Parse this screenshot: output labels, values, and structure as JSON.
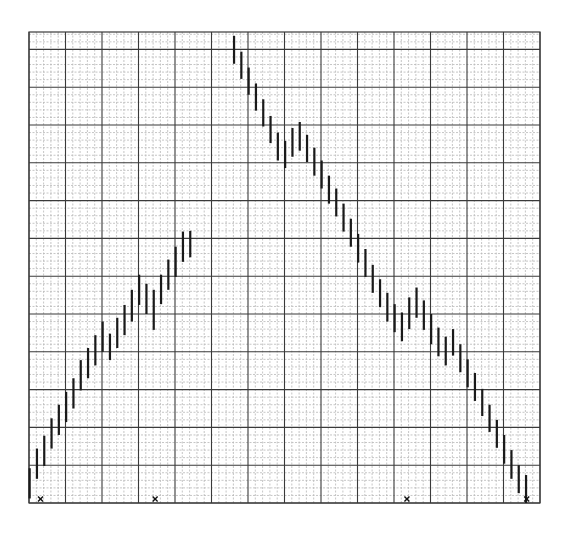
{
  "chart_data": {
    "type": "bar",
    "subtype": "high-low range bars (no open/close ticks) on graph paper",
    "title": "",
    "xlabel": "",
    "ylabel": "",
    "grid": {
      "on": true,
      "major_columns": 14,
      "minor_per_major_x": 5,
      "major_rows": 12.4,
      "minor_per_major_y": 5,
      "units": "minor grid boxes from bottom edge"
    },
    "ylim": [
      0,
      62
    ],
    "x": [
      1,
      2,
      3,
      4,
      5,
      6,
      7,
      8,
      9,
      10,
      11,
      12,
      13,
      14,
      15,
      16,
      17,
      18,
      19,
      20,
      21,
      22,
      23,
      24,
      25,
      26,
      27,
      28,
      29,
      30,
      31,
      32,
      33,
      34,
      35,
      36,
      37,
      38,
      39,
      40,
      41,
      42,
      43,
      44,
      45,
      46,
      47,
      48,
      49,
      50,
      51,
      52,
      53,
      54,
      55,
      56,
      57,
      58,
      59,
      60,
      61,
      62,
      63,
      64,
      65,
      66,
      67,
      68,
      69
    ],
    "bars": [
      {
        "col": 0.5,
        "high": 4.6,
        "low": 0.6
      },
      {
        "col": 1.5,
        "high": 7.2,
        "low": 3.2
      },
      {
        "col": 2.5,
        "high": 8.9,
        "low": 4.9
      },
      {
        "col": 3.5,
        "high": 11.2,
        "low": 7.2
      },
      {
        "col": 4.5,
        "high": 13.0,
        "low": 9.0
      },
      {
        "col": 5.5,
        "high": 14.7,
        "low": 10.7
      },
      {
        "col": 6.5,
        "high": 16.5,
        "low": 12.5
      },
      {
        "col": 7.5,
        "high": 18.9,
        "low": 14.9
      },
      {
        "col": 8.5,
        "high": 20.5,
        "low": 16.5
      },
      {
        "col": 9.5,
        "high": 22.2,
        "low": 18.2
      },
      {
        "col": 10.5,
        "high": 24.0,
        "low": 20.0
      },
      {
        "col": 11.5,
        "high": 22.4,
        "low": 18.9
      },
      {
        "col": 12.5,
        "high": 24.5,
        "low": 20.5
      },
      {
        "col": 13.5,
        "high": 26.2,
        "low": 22.2
      },
      {
        "col": 14.5,
        "high": 28.2,
        "low": 24.0
      },
      {
        "col": 15.5,
        "high": 30.2,
        "low": 26.2
      },
      {
        "col": 16.5,
        "high": 29.0,
        "low": 25.0
      },
      {
        "col": 17.5,
        "high": 28.2,
        "low": 22.9
      },
      {
        "col": 18.5,
        "high": 30.2,
        "low": 26.3
      },
      {
        "col": 19.5,
        "high": 32.2,
        "low": 28.2
      },
      {
        "col": 20.5,
        "high": 33.9,
        "low": 29.9
      },
      {
        "col": 21.5,
        "high": 35.9,
        "low": 31.9
      },
      {
        "col": 22.5,
        "high": 36.0,
        "low": 32.5
      },
      {
        "col": 28.5,
        "high": 61.8,
        "low": 58.1
      },
      {
        "col": 29.5,
        "high": 59.7,
        "low": 56.1
      },
      {
        "col": 30.5,
        "high": 57.6,
        "low": 54.0
      },
      {
        "col": 31.5,
        "high": 55.5,
        "low": 51.9
      },
      {
        "col": 32.5,
        "high": 53.4,
        "low": 49.8
      },
      {
        "col": 33.5,
        "high": 51.2,
        "low": 47.6
      },
      {
        "col": 34.5,
        "high": 49.0,
        "low": 45.3
      },
      {
        "col": 35.5,
        "high": 47.9,
        "low": 44.3
      },
      {
        "col": 36.5,
        "high": 49.6,
        "low": 45.8
      },
      {
        "col": 37.5,
        "high": 50.4,
        "low": 46.6
      },
      {
        "col": 38.5,
        "high": 48.7,
        "low": 45.1
      },
      {
        "col": 39.5,
        "high": 47.0,
        "low": 43.3
      },
      {
        "col": 40.5,
        "high": 45.3,
        "low": 41.6
      },
      {
        "col": 41.5,
        "high": 43.3,
        "low": 39.6
      },
      {
        "col": 42.5,
        "high": 41.6,
        "low": 37.9
      },
      {
        "col": 43.5,
        "high": 39.6,
        "low": 35.9
      },
      {
        "col": 44.5,
        "high": 37.6,
        "low": 33.9
      },
      {
        "col": 45.5,
        "high": 35.6,
        "low": 31.8
      },
      {
        "col": 46.5,
        "high": 33.6,
        "low": 29.9
      },
      {
        "col": 47.5,
        "high": 31.5,
        "low": 27.8
      },
      {
        "col": 48.5,
        "high": 29.6,
        "low": 25.9
      },
      {
        "col": 49.5,
        "high": 27.8,
        "low": 24.0
      },
      {
        "col": 50.5,
        "high": 26.3,
        "low": 22.6
      },
      {
        "col": 51.5,
        "high": 25.2,
        "low": 21.4
      },
      {
        "col": 52.5,
        "high": 27.2,
        "low": 23.0
      },
      {
        "col": 53.5,
        "high": 28.5,
        "low": 24.5
      },
      {
        "col": 54.5,
        "high": 26.8,
        "low": 22.9
      },
      {
        "col": 55.5,
        "high": 25.0,
        "low": 21.0
      },
      {
        "col": 56.5,
        "high": 23.2,
        "low": 19.4
      },
      {
        "col": 57.5,
        "high": 22.0,
        "low": 18.2
      },
      {
        "col": 58.5,
        "high": 23.0,
        "low": 19.5
      },
      {
        "col": 59.5,
        "high": 21.0,
        "low": 17.3
      },
      {
        "col": 60.5,
        "high": 19.0,
        "low": 15.3
      },
      {
        "col": 61.5,
        "high": 17.2,
        "low": 13.5
      },
      {
        "col": 62.5,
        "high": 15.1,
        "low": 11.5
      },
      {
        "col": 63.5,
        "high": 13.0,
        "low": 9.4
      },
      {
        "col": 64.5,
        "high": 11.0,
        "low": 7.3
      },
      {
        "col": 65.5,
        "high": 9.0,
        "low": 5.2
      },
      {
        "col": 66.5,
        "high": 7.0,
        "low": 3.2
      },
      {
        "col": 67.5,
        "high": 5.0,
        "low": 1.3
      },
      {
        "col": 68.5,
        "high": 3.7,
        "low": 0.0
      }
    ],
    "markers": [
      {
        "symbol": "x",
        "col": 1.3,
        "y": 0.5
      },
      {
        "symbol": "x",
        "col": 17.0,
        "y": 0.5
      },
      {
        "symbol": "x",
        "col": 51.5,
        "y": 0.5
      },
      {
        "symbol": "x",
        "col": 67.9,
        "y": 0.5
      }
    ],
    "legend": null,
    "annotations": []
  },
  "style": {
    "bar_color": "#1a1a1a",
    "major_grid_color": "#3a3a3a",
    "minor_grid_color": "#b8b8b8",
    "marker_color": "#111111",
    "background": "#ffffff"
  }
}
